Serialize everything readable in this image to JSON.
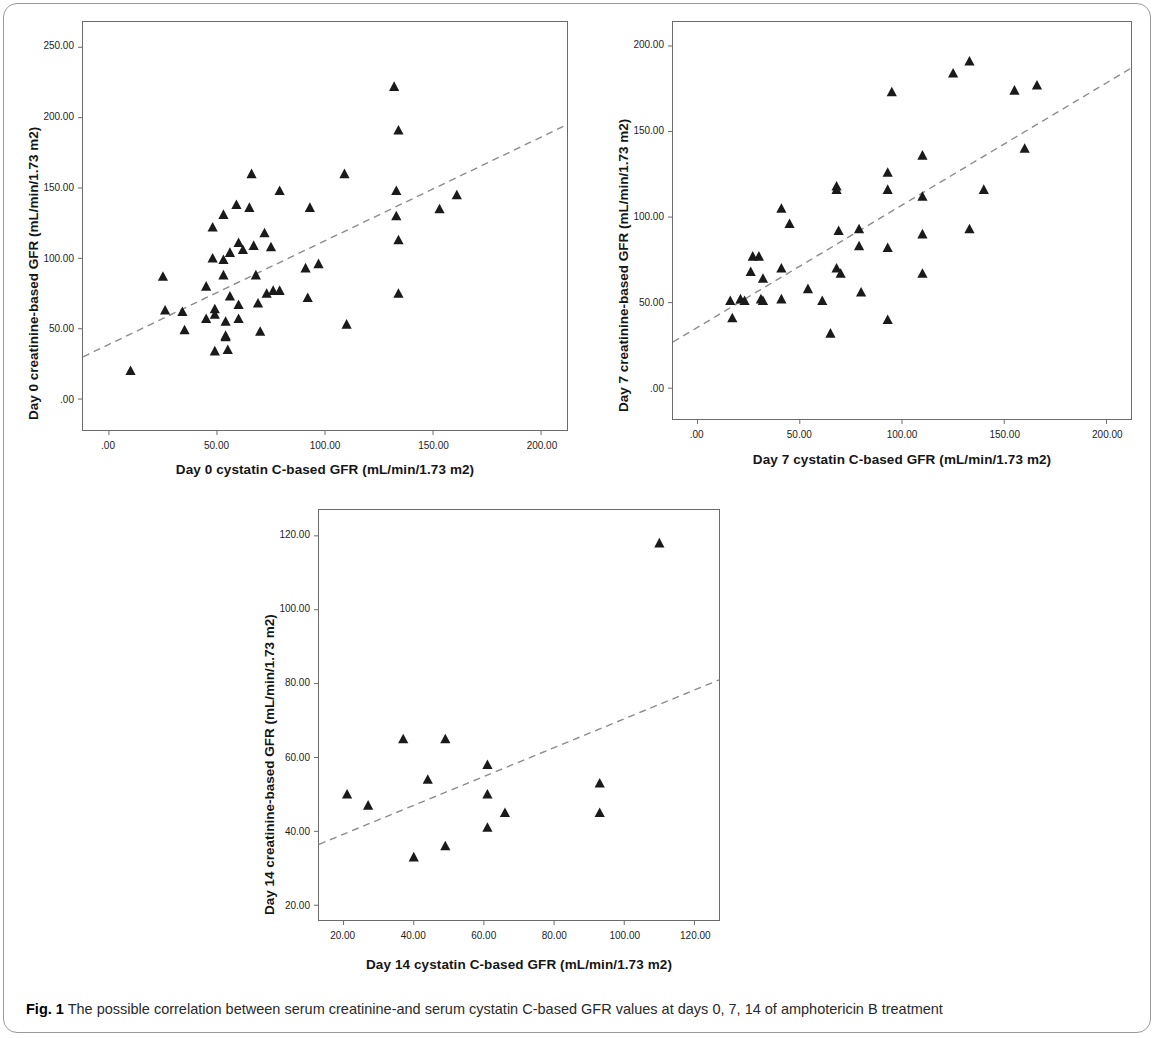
{
  "figure": {
    "caption_label": "Fig. 1",
    "caption_text": " The possible correlation between serum creatinine-and serum cystatin C-based GFR values at days 0, 7, 14 of amphotericin B treatment"
  },
  "chart_data": [
    {
      "id": "day0",
      "type": "scatter",
      "title": "",
      "xlabel": "Day 0 cystatin C-based GFR (mL/min/1.73 m2)",
      "ylabel": "Day 0 creatinine-based GFR (mL/min/1.73 m2)",
      "xlim": [
        -12,
        212
      ],
      "ylim": [
        -22,
        268
      ],
      "xticks": [
        0,
        50,
        100,
        150,
        200
      ],
      "xticklabels": [
        ".00",
        "50.00",
        "100.00",
        "150.00",
        "200.00"
      ],
      "yticks": [
        0,
        50,
        100,
        150,
        200,
        250
      ],
      "yticklabels": [
        ".00",
        "50.00",
        "100.00",
        "150.00",
        "200.00",
        "250.00"
      ],
      "grid": false,
      "legend": "none",
      "marker": "triangle",
      "marker_color": "#1a1a1a",
      "fit_line": {
        "style": "dashed",
        "color": "#8c8c8c",
        "x": [
          -12,
          212
        ],
        "y": [
          30,
          195
        ]
      },
      "points": [
        {
          "x": 10,
          "y": 20
        },
        {
          "x": 25,
          "y": 87
        },
        {
          "x": 26,
          "y": 63
        },
        {
          "x": 34,
          "y": 62
        },
        {
          "x": 35,
          "y": 49
        },
        {
          "x": 45,
          "y": 80
        },
        {
          "x": 45,
          "y": 57
        },
        {
          "x": 48,
          "y": 122
        },
        {
          "x": 48,
          "y": 100
        },
        {
          "x": 49,
          "y": 64
        },
        {
          "x": 49,
          "y": 60
        },
        {
          "x": 49,
          "y": 34
        },
        {
          "x": 53,
          "y": 131
        },
        {
          "x": 53,
          "y": 88
        },
        {
          "x": 53,
          "y": 99
        },
        {
          "x": 54,
          "y": 55
        },
        {
          "x": 54,
          "y": 45
        },
        {
          "x": 54,
          "y": 44
        },
        {
          "x": 55,
          "y": 35
        },
        {
          "x": 56,
          "y": 104
        },
        {
          "x": 56,
          "y": 73
        },
        {
          "x": 59,
          "y": 138
        },
        {
          "x": 60,
          "y": 111
        },
        {
          "x": 60,
          "y": 67
        },
        {
          "x": 60,
          "y": 57
        },
        {
          "x": 62,
          "y": 106
        },
        {
          "x": 65,
          "y": 136
        },
        {
          "x": 66,
          "y": 160
        },
        {
          "x": 67,
          "y": 109
        },
        {
          "x": 68,
          "y": 88
        },
        {
          "x": 69,
          "y": 68
        },
        {
          "x": 70,
          "y": 48
        },
        {
          "x": 72,
          "y": 118
        },
        {
          "x": 73,
          "y": 75
        },
        {
          "x": 75,
          "y": 108
        },
        {
          "x": 76,
          "y": 77
        },
        {
          "x": 79,
          "y": 77
        },
        {
          "x": 79,
          "y": 148
        },
        {
          "x": 91,
          "y": 93
        },
        {
          "x": 92,
          "y": 72
        },
        {
          "x": 93,
          "y": 136
        },
        {
          "x": 97,
          "y": 96
        },
        {
          "x": 109,
          "y": 160
        },
        {
          "x": 110,
          "y": 53
        },
        {
          "x": 132,
          "y": 222
        },
        {
          "x": 133,
          "y": 148
        },
        {
          "x": 133,
          "y": 130
        },
        {
          "x": 134,
          "y": 191
        },
        {
          "x": 134,
          "y": 113
        },
        {
          "x": 134,
          "y": 75
        },
        {
          "x": 153,
          "y": 135
        },
        {
          "x": 161,
          "y": 145
        }
      ]
    },
    {
      "id": "day7",
      "type": "scatter",
      "title": "",
      "xlabel": "Day 7 cystatin C-based GFR (mL/min/1.73 m2)",
      "ylabel": "Day 7 creatinine-based GFR (mL/min/1.73 m2)",
      "xlim": [
        -12,
        212
      ],
      "ylim": [
        -18,
        214
      ],
      "xticks": [
        0,
        50,
        100,
        150,
        200
      ],
      "xticklabels": [
        ".00",
        "50.00",
        "100.00",
        "150.00",
        "200.00"
      ],
      "yticks": [
        0,
        50,
        100,
        150,
        200
      ],
      "yticklabels": [
        ".00",
        "50.00",
        "100.00",
        "150.00",
        "200.00"
      ],
      "grid": false,
      "legend": "none",
      "marker": "triangle",
      "marker_color": "#1a1a1a",
      "fit_line": {
        "style": "dashed",
        "color": "#8c8c8c",
        "x": [
          -12,
          212
        ],
        "y": [
          27,
          187
        ]
      },
      "points": [
        {
          "x": 16,
          "y": 51
        },
        {
          "x": 17,
          "y": 41
        },
        {
          "x": 21,
          "y": 52
        },
        {
          "x": 23,
          "y": 51
        },
        {
          "x": 26,
          "y": 68
        },
        {
          "x": 27,
          "y": 77
        },
        {
          "x": 30,
          "y": 77
        },
        {
          "x": 31,
          "y": 52
        },
        {
          "x": 32,
          "y": 51
        },
        {
          "x": 32,
          "y": 64
        },
        {
          "x": 41,
          "y": 105
        },
        {
          "x": 41,
          "y": 70
        },
        {
          "x": 41,
          "y": 52
        },
        {
          "x": 45,
          "y": 96
        },
        {
          "x": 54,
          "y": 58
        },
        {
          "x": 61,
          "y": 51
        },
        {
          "x": 65,
          "y": 32
        },
        {
          "x": 68,
          "y": 116
        },
        {
          "x": 68,
          "y": 118
        },
        {
          "x": 68,
          "y": 70
        },
        {
          "x": 69,
          "y": 92
        },
        {
          "x": 70,
          "y": 67
        },
        {
          "x": 79,
          "y": 93
        },
        {
          "x": 79,
          "y": 83
        },
        {
          "x": 80,
          "y": 56
        },
        {
          "x": 93,
          "y": 126
        },
        {
          "x": 93,
          "y": 116
        },
        {
          "x": 93,
          "y": 82
        },
        {
          "x": 93,
          "y": 40
        },
        {
          "x": 95,
          "y": 173
        },
        {
          "x": 110,
          "y": 136
        },
        {
          "x": 110,
          "y": 112
        },
        {
          "x": 110,
          "y": 90
        },
        {
          "x": 110,
          "y": 67
        },
        {
          "x": 125,
          "y": 184
        },
        {
          "x": 133,
          "y": 191
        },
        {
          "x": 133,
          "y": 93
        },
        {
          "x": 140,
          "y": 116
        },
        {
          "x": 160,
          "y": 140
        },
        {
          "x": 155,
          "y": 174
        },
        {
          "x": 166,
          "y": 177
        }
      ]
    },
    {
      "id": "day14",
      "type": "scatter",
      "title": "",
      "xlabel": "Day 14 cystatin C-based GFR (mL/min/1.73 m2)",
      "ylabel": "Day 14 creatinine-based GFR (mL/min/1.73 m2)",
      "xlim": [
        13,
        127
      ],
      "ylim": [
        16,
        127
      ],
      "xticks": [
        20,
        40,
        60,
        80,
        100,
        120
      ],
      "xticklabels": [
        "20.00",
        "40.00",
        "60.00",
        "80.00",
        "100.00",
        "120.00"
      ],
      "yticks": [
        20,
        40,
        60,
        80,
        100,
        120
      ],
      "yticklabels": [
        "20.00",
        "40.00",
        "60.00",
        "80.00",
        "100.00",
        "120.00"
      ],
      "grid": false,
      "legend": "none",
      "marker": "triangle",
      "marker_color": "#1a1a1a",
      "fit_line": {
        "style": "dashed",
        "color": "#8c8c8c",
        "x": [
          13,
          127
        ],
        "y": [
          36.5,
          81
        ]
      },
      "points": [
        {
          "x": 21,
          "y": 50
        },
        {
          "x": 27,
          "y": 47
        },
        {
          "x": 37,
          "y": 65
        },
        {
          "x": 40,
          "y": 33
        },
        {
          "x": 44,
          "y": 54
        },
        {
          "x": 49,
          "y": 65
        },
        {
          "x": 49,
          "y": 36
        },
        {
          "x": 61,
          "y": 58
        },
        {
          "x": 61,
          "y": 50
        },
        {
          "x": 61,
          "y": 41
        },
        {
          "x": 66,
          "y": 45
        },
        {
          "x": 93,
          "y": 53
        },
        {
          "x": 93,
          "y": 45
        },
        {
          "x": 110,
          "y": 118
        }
      ]
    }
  ]
}
